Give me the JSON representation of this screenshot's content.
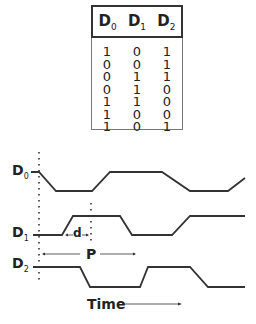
{
  "table": {
    "headers": [
      {
        "base": "D",
        "sub": "0"
      },
      {
        "base": "D",
        "sub": "1"
      },
      {
        "base": "D",
        "sub": "2"
      }
    ],
    "rows": [
      [
        "1",
        "0",
        "1"
      ],
      [
        "0",
        "0",
        "1"
      ],
      [
        "0",
        "1",
        "1"
      ],
      [
        "0",
        "1",
        "0"
      ],
      [
        "1",
        "1",
        "0"
      ],
      [
        "1",
        "0",
        "0"
      ],
      [
        "1",
        "0",
        "1"
      ]
    ]
  },
  "signals": [
    {
      "base": "D",
      "sub": "0"
    },
    {
      "base": "D",
      "sub": "1"
    },
    {
      "base": "D",
      "sub": "2"
    }
  ],
  "annotations": {
    "delay": "d",
    "period": "P",
    "time": "Time"
  },
  "colors": {
    "line": "#333333",
    "border": "#777777"
  }
}
